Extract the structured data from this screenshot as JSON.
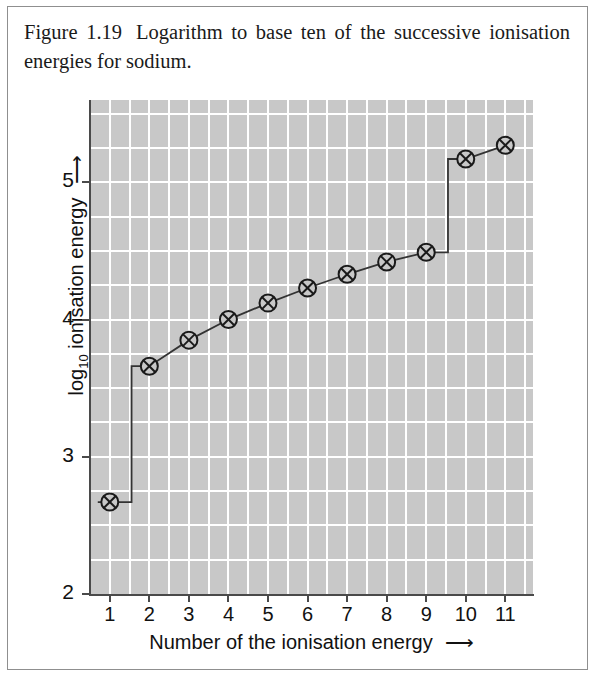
{
  "caption": {
    "figure_number": "Figure 1.19",
    "text": "Logarithm to base ten of the successive ionisation energies for sodium."
  },
  "colors": {
    "plot_background": "#c8c8c8",
    "gridline": "#ffffff",
    "axis": "#4a4a4a",
    "series_line": "#333333",
    "marker": "#1a1a1a",
    "page_background": "#ffffff",
    "border": "#8f8f8f"
  },
  "chart_data": {
    "type": "line",
    "title": "",
    "xlabel": "Number of the ionisation energy",
    "ylabel": "log10 ionisation energy",
    "xlabel_arrow": "⟶",
    "ylabel_arrow": "⟶",
    "x": [
      1,
      2,
      3,
      4,
      5,
      6,
      7,
      8,
      9,
      10,
      11
    ],
    "values": [
      2.67,
      3.66,
      3.85,
      4.0,
      4.12,
      4.23,
      4.33,
      4.42,
      4.49,
      5.17,
      5.27
    ],
    "series": [
      {
        "name": "log10 ionisation energy of sodium",
        "values": [
          2.67,
          3.66,
          3.85,
          4.0,
          4.12,
          4.23,
          4.33,
          4.42,
          4.49,
          5.17,
          5.27
        ]
      }
    ],
    "xlim": [
      0.5,
      11.7
    ],
    "ylim": [
      2.0,
      5.6
    ],
    "x_ticks": [
      1,
      2,
      3,
      4,
      5,
      6,
      7,
      8,
      9,
      10,
      11
    ],
    "x_tick_labels": [
      "1",
      "2",
      "3",
      "4",
      "5",
      "6",
      "7",
      "8",
      "9",
      "10",
      "11"
    ],
    "y_ticks": [
      2,
      3,
      4,
      5
    ],
    "y_tick_labels": [
      "2",
      "3",
      "4",
      "5"
    ],
    "y_minor_step": 0.25,
    "x_minor_step": 0.5,
    "grid": true,
    "grid_color": "#ffffff",
    "legend": false,
    "legend_position": "none",
    "marker_style": "circle-with-cross",
    "step_between": [
      [
        1,
        2
      ],
      [
        9,
        10
      ]
    ]
  }
}
